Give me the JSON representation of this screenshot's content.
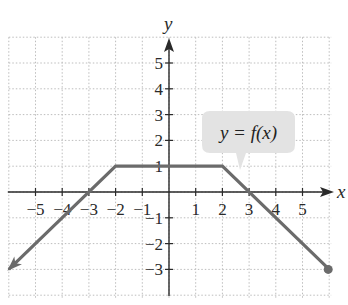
{
  "chart_data": {
    "type": "line",
    "title": "",
    "xlabel": "x",
    "ylabel": "y",
    "xlim": [
      -6,
      6
    ],
    "ylim": [
      -4,
      6
    ],
    "grid": true,
    "grid_style": "dotted",
    "x_ticks": [
      -5,
      -4,
      -3,
      -2,
      -1,
      1,
      2,
      3,
      4,
      5
    ],
    "y_ticks": [
      -3,
      -2,
      -1,
      1,
      2,
      3,
      4,
      5
    ],
    "x_tick_labels": [
      "−5",
      "−4",
      "−3",
      "−2",
      "−1",
      "1",
      "2",
      "3",
      "4",
      "5"
    ],
    "y_tick_labels": [
      "−3",
      "−2",
      "−1",
      "1",
      "2",
      "3",
      "4",
      "5"
    ],
    "series": [
      {
        "name": "y = f(x)",
        "points": [
          [
            -6,
            -3
          ],
          [
            -2,
            1
          ],
          [
            2,
            1
          ],
          [
            6,
            -3
          ]
        ],
        "left_end": "arrow",
        "right_end": "closed-dot",
        "color": "#6b6b6b"
      }
    ],
    "annotations": [
      {
        "text": "y = f(x)",
        "type": "callout",
        "anchor": [
          2.5,
          0.9
        ]
      }
    ]
  },
  "colors": {
    "curve": "#6b6b6b",
    "axis": "#2a2a2a",
    "grid": "#bdbdbd",
    "callout_fill": "#e3e3e3"
  },
  "labels": {
    "x_axis": "x",
    "y_axis": "y",
    "callout": "y = f(x)"
  }
}
